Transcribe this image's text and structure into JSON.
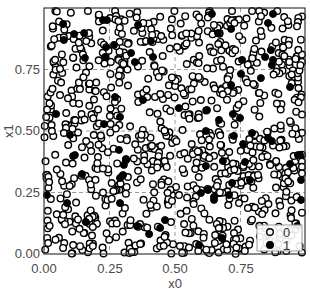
{
  "chart_data": {
    "type": "scatter",
    "title": "",
    "xlabel": "x0",
    "ylabel": "x1",
    "xlim": [
      0.0,
      1.0
    ],
    "ylim": [
      0.0,
      1.0
    ],
    "x_ticks": [
      "0.00",
      "0.25",
      "0.50",
      "0.75"
    ],
    "y_ticks": [
      "0.00",
      "0.25",
      "0.50",
      "0.75"
    ],
    "grid": {
      "on": true,
      "style": "dashed",
      "color": "#9a9a9a"
    },
    "legend": {
      "position": "lower right",
      "entries": [
        {
          "label": "0",
          "marker": "open-circle"
        },
        {
          "label": "1",
          "marker": "filled-circle"
        }
      ]
    },
    "series": [
      {
        "name": "0",
        "marker": "open-circle",
        "color": "#000000",
        "count_approx": 900,
        "generated": {
          "seed": 12345,
          "n": 900
        }
      },
      {
        "name": "1",
        "marker": "filled-circle",
        "color": "#000000",
        "points": [
          [
            0.073,
            0.935
          ],
          [
            0.076,
            0.87
          ],
          [
            0.115,
            0.894
          ],
          [
            0.153,
            0.898
          ],
          [
            0.156,
            0.797
          ],
          [
            0.233,
            0.801
          ],
          [
            0.237,
            0.841
          ],
          [
            0.225,
            0.951
          ],
          [
            0.24,
            0.951
          ],
          [
            0.267,
            0.85
          ],
          [
            0.332,
            0.817
          ],
          [
            0.359,
            0.931
          ],
          [
            0.408,
            0.866
          ],
          [
            0.416,
            0.801
          ],
          [
            0.347,
            0.78
          ],
          [
            0.641,
            0.976
          ],
          [
            0.664,
            0.898
          ],
          [
            0.714,
            0.915
          ],
          [
            0.855,
            0.939
          ],
          [
            0.874,
            0.976
          ],
          [
            0.866,
            0.829
          ],
          [
            0.874,
            0.789
          ],
          [
            0.87,
            0.768
          ],
          [
            0.756,
            0.789
          ],
          [
            0.844,
            0.801
          ],
          [
            0.752,
            0.732
          ],
          [
            0.828,
            0.715
          ],
          [
            0.939,
            0.679
          ],
          [
            0.714,
            0.687
          ],
          [
            0.046,
            0.569
          ],
          [
            0.099,
            0.484
          ],
          [
            0.111,
            0.398
          ],
          [
            0.118,
            0.402
          ],
          [
            0.229,
            0.528
          ],
          [
            0.271,
            0.638
          ],
          [
            0.286,
            0.423
          ],
          [
            0.313,
            0.386
          ],
          [
            0.305,
            0.362
          ],
          [
            0.29,
            0.557
          ],
          [
            0.378,
            0.626
          ],
          [
            0.515,
            0.593
          ],
          [
            0.622,
            0.585
          ],
          [
            0.618,
            0.5
          ],
          [
            0.668,
            0.545
          ],
          [
            0.618,
            0.358
          ],
          [
            0.721,
            0.569
          ],
          [
            0.748,
            0.553
          ],
          [
            0.725,
            0.48
          ],
          [
            0.76,
            0.447
          ],
          [
            0.794,
            0.492
          ],
          [
            0.855,
            0.472
          ],
          [
            0.87,
            0.459
          ],
          [
            0.683,
            0.378
          ],
          [
            0.767,
            0.374
          ],
          [
            0.977,
            0.402
          ],
          [
            0.969,
            0.402
          ],
          [
            0.939,
            0.366
          ],
          [
            0.011,
            0.24
          ],
          [
            0.088,
            0.207
          ],
          [
            0.16,
            0.13
          ],
          [
            0.298,
            0.317
          ],
          [
            0.145,
            0.325
          ],
          [
            0.29,
            0.309
          ],
          [
            0.302,
            0.321
          ],
          [
            0.29,
            0.207
          ],
          [
            0.355,
            0.114
          ],
          [
            0.401,
            0.081
          ],
          [
            0.443,
            0.106
          ],
          [
            0.462,
            0.138
          ],
          [
            0.599,
            0.248
          ],
          [
            0.626,
            0.26
          ],
          [
            0.649,
            0.232
          ],
          [
            0.649,
            0.22
          ],
          [
            0.592,
            0.037
          ],
          [
            0.706,
            0.24
          ],
          [
            0.786,
            0.301
          ],
          [
            0.855,
            0.077
          ],
          [
            0.679,
            0.065
          ],
          [
            0.718,
            0.289
          ],
          [
            0.981,
            0.22
          ],
          [
            0.966,
            0.114
          ],
          [
            0.981,
            0.301
          ]
        ]
      }
    ]
  },
  "axes": {
    "xlabel": "x0",
    "ylabel": "x1",
    "x_ticks": [
      {
        "label": "0.00",
        "value": 0.0
      },
      {
        "label": "0.25",
        "value": 0.25
      },
      {
        "label": "0.50",
        "value": 0.5
      },
      {
        "label": "0.75",
        "value": 0.75
      }
    ],
    "y_ticks": [
      {
        "label": "0.00",
        "value": 0.0
      },
      {
        "label": "0.25",
        "value": 0.25
      },
      {
        "label": "0.50",
        "value": 0.5
      },
      {
        "label": "0.75",
        "value": 0.75
      }
    ]
  },
  "legend": {
    "items": [
      {
        "label": "0"
      },
      {
        "label": "1"
      }
    ]
  },
  "style": {
    "frame_color": "#3a3a3a",
    "grid_color": "#9a9a9a",
    "marker_color": "#000000",
    "legend_border": "#9a9a9a"
  }
}
